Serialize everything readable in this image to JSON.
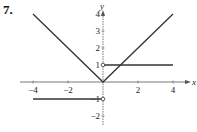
{
  "problem": {
    "number": "7."
  },
  "chart_data": {
    "type": "line",
    "title": "",
    "xlabel": "x",
    "ylabel": "y",
    "xlim": [
      -4.3,
      4.6
    ],
    "ylim": [
      -2.6,
      4.7
    ],
    "grid": false,
    "x_ticks": [
      -4,
      -2,
      2,
      4
    ],
    "x_tick_labels": [
      "−4",
      "−2",
      "2",
      "4"
    ],
    "y_ticks": [
      4,
      3,
      2,
      1,
      -1,
      -2
    ],
    "y_tick_labels": [
      "4",
      "3",
      "2",
      "1",
      "−1",
      "−2"
    ],
    "series": [
      {
        "name": "|x|",
        "points": [
          [
            -4,
            4
          ],
          [
            0,
            0
          ],
          [
            4,
            4
          ]
        ]
      },
      {
        "name": "y=1 for x>0",
        "points": [
          [
            0,
            1
          ],
          [
            4,
            1
          ]
        ],
        "open_endpoint": [
          0,
          1
        ]
      },
      {
        "name": "y=-1 for x<0",
        "points": [
          [
            -4,
            -1
          ],
          [
            0,
            -1
          ]
        ],
        "open_endpoint": [
          0,
          -1
        ]
      }
    ],
    "colors": {
      "line": "#333333",
      "axis": "#555555"
    }
  }
}
